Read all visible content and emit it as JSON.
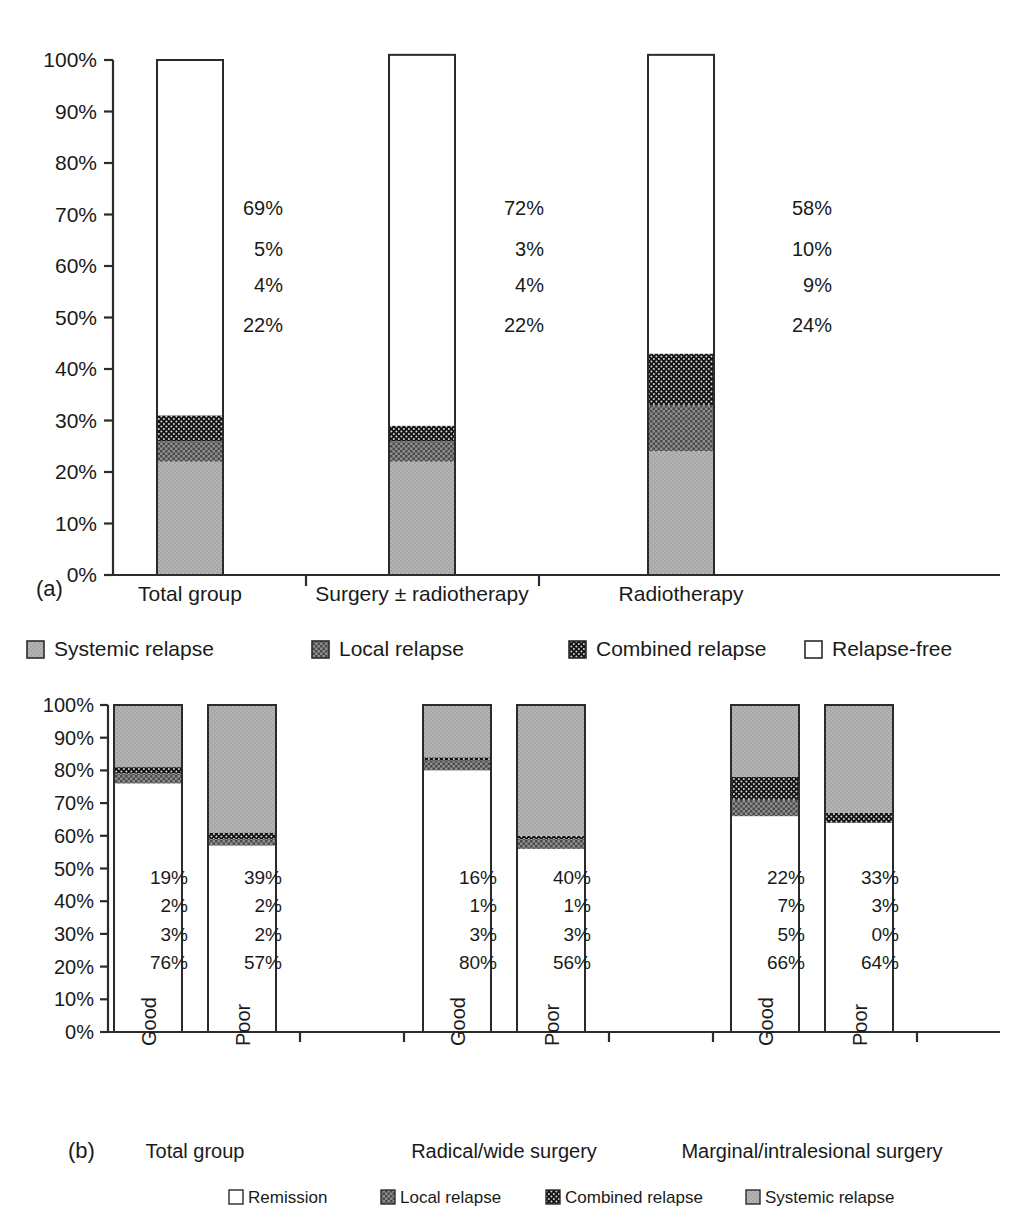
{
  "figure": {
    "panel_a_tag": "(a)",
    "panel_b_tag": "(b)"
  },
  "chart_data": [
    {
      "id": "panel-a",
      "type": "bar",
      "stacked": true,
      "title": "",
      "xlabel": "",
      "ylabel": "",
      "ylim": [
        0,
        100
      ],
      "grid": false,
      "legend_position": "below",
      "ytick_labels": [
        "0%",
        "10%",
        "20%",
        "30%",
        "40%",
        "50%",
        "60%",
        "70%",
        "80%",
        "90%",
        "100%"
      ],
      "yticks": [
        0,
        10,
        20,
        30,
        40,
        50,
        60,
        70,
        80,
        90,
        100
      ],
      "categories": [
        "Total group",
        "Surgery ± radiotherapy",
        "Radiotherapy"
      ],
      "series": [
        {
          "name": "Systemic relapse",
          "fill": "systemic",
          "values": [
            22,
            22,
            24
          ],
          "labels": [
            "22%",
            "22%",
            "24%"
          ]
        },
        {
          "name": "Local relapse",
          "fill": "local",
          "values": [
            4,
            4,
            9
          ],
          "labels": [
            "4%",
            "4%",
            "9%"
          ]
        },
        {
          "name": "Combined relapse",
          "fill": "combined",
          "values": [
            5,
            3,
            10
          ],
          "labels": [
            "5%",
            "3%",
            "10%"
          ]
        },
        {
          "name": "Relapse-free",
          "fill": "free",
          "values": [
            69,
            72,
            58
          ],
          "labels": [
            "69%",
            "72%",
            "58%"
          ]
        }
      ],
      "legend": [
        {
          "label": "Systemic relapse",
          "fill": "systemic"
        },
        {
          "label": "Local relapse",
          "fill": "local"
        },
        {
          "label": "Combined relapse",
          "fill": "combined"
        },
        {
          "label": "Relapse-free",
          "fill": "free"
        }
      ]
    },
    {
      "id": "panel-b",
      "type": "bar",
      "stacked": true,
      "title": "",
      "xlabel": "",
      "ylabel": "",
      "ylim": [
        0,
        100
      ],
      "grid": false,
      "legend_position": "below",
      "ytick_labels": [
        "0%",
        "10%",
        "20%",
        "30%",
        "40%",
        "50%",
        "60%",
        "70%",
        "80%",
        "90%",
        "100%"
      ],
      "yticks": [
        0,
        10,
        20,
        30,
        40,
        50,
        60,
        70,
        80,
        90,
        100
      ],
      "groups": [
        "Total group",
        "Radical/wide surgery",
        "Marginal/intralesional surgery"
      ],
      "categories": [
        "Good",
        "Poor",
        "Good",
        "Poor",
        "Good",
        "Poor"
      ],
      "series": [
        {
          "name": "Remission",
          "fill": "free",
          "values": [
            76,
            57,
            80,
            56,
            66,
            64
          ],
          "labels": [
            "76%",
            "57%",
            "80%",
            "56%",
            "66%",
            "64%"
          ]
        },
        {
          "name": "Local relapse",
          "fill": "local",
          "values": [
            3,
            2,
            3,
            3,
            5,
            0
          ],
          "labels": [
            "3%",
            "2%",
            "3%",
            "3%",
            "5%",
            "0%"
          ]
        },
        {
          "name": "Combined relapse",
          "fill": "combined",
          "values": [
            2,
            2,
            1,
            1,
            7,
            3
          ],
          "labels": [
            "2%",
            "2%",
            "1%",
            "1%",
            "7%",
            "3%"
          ]
        },
        {
          "name": "Systemic relapse",
          "fill": "systemic",
          "values": [
            19,
            39,
            16,
            40,
            22,
            33
          ],
          "labels": [
            "19%",
            "39%",
            "16%",
            "40%",
            "22%",
            "33%"
          ]
        }
      ],
      "legend": [
        {
          "label": "Remission",
          "fill": "free"
        },
        {
          "label": "Local relapse",
          "fill": "local"
        },
        {
          "label": "Combined relapse",
          "fill": "combined"
        },
        {
          "label": "Systemic relapse",
          "fill": "systemic"
        }
      ]
    }
  ],
  "colors": {
    "systemic": "#b0b0b0",
    "local": "#8a8a8a",
    "combined": "#1c1c1c",
    "free": "#ffffff",
    "axis": "#2b2b2b",
    "text": "#1a1a1a"
  }
}
